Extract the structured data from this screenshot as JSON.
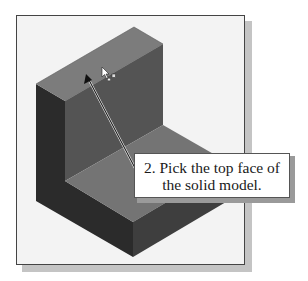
{
  "figure": {
    "colors": {
      "frame_background": "#f3f3f3",
      "frame_border": "#444444",
      "frame_shadow": "#c4c4c4",
      "left_face": "#2b2b2b",
      "upright_front_face": "#545454",
      "top_faces": "#7c7c7c",
      "base_top_face": "#747474",
      "base_front_face": "#3e3e3e",
      "arrow": "#1a1a1a"
    },
    "cursor_icon": "select-pointer-icon"
  },
  "callout": {
    "line1": "2. Pick the top face of",
    "line2": "the solid model."
  }
}
